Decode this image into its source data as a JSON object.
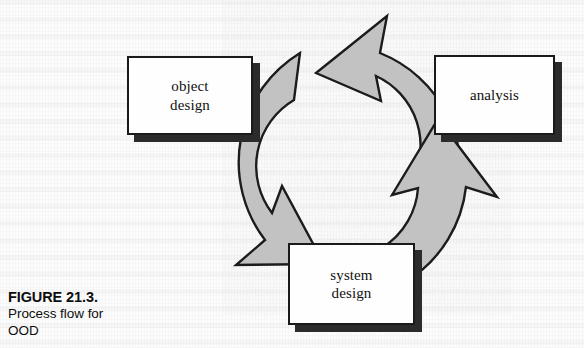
{
  "figure": {
    "caption_number": "FIGURE 21.3.",
    "caption_text": "Process flow for\nOOD",
    "diagram_type": "cyclic-process-flow",
    "colors": {
      "ring_fill": "#c2c2c2",
      "ring_stroke": "#1a1a1a",
      "box_fill": "#fefefe",
      "box_stroke": "#1a1a1a",
      "box_shadow": "#2b2b2b",
      "page_background": "#fdfdfd",
      "text": "#111111"
    }
  },
  "nodes": [
    {
      "id": "object-design",
      "label": "object\ndesign",
      "position": "left",
      "x": 127,
      "y": 56,
      "width": 126,
      "height": 79
    },
    {
      "id": "analysis",
      "label": "analysis",
      "position": "upper-right",
      "x": 434,
      "y": 55,
      "width": 121,
      "height": 80
    },
    {
      "id": "system-design",
      "label": "system\ndesign",
      "position": "bottom",
      "x": 288,
      "y": 243,
      "width": 127,
      "height": 82
    }
  ],
  "ring": {
    "center_x": 340,
    "center_y": 172,
    "outer_radius": 128,
    "inner_radius": 77,
    "direction": "counter-clockwise",
    "segment_count": 3,
    "arrowheads": [
      {
        "id": "arrowhead-top",
        "points_toward": "object-design"
      },
      {
        "id": "arrowhead-lower-left",
        "points_toward": "system-design"
      },
      {
        "id": "arrowhead-right",
        "points_toward": "analysis"
      }
    ]
  }
}
